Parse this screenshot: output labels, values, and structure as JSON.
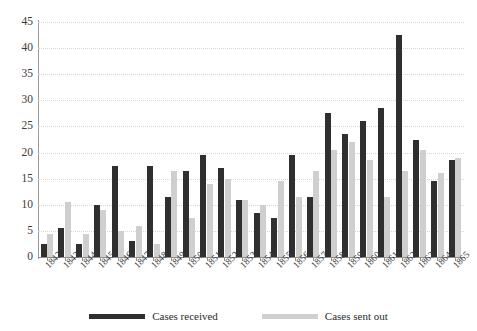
{
  "chart_data": {
    "type": "bar",
    "title": "",
    "subtitle": "",
    "xlabel": "",
    "ylabel": "",
    "ylim": [
      0,
      45
    ],
    "ytick_step": 5,
    "yticks": [
      0,
      5,
      10,
      15,
      20,
      25,
      30,
      35,
      40,
      45
    ],
    "grid": true,
    "legend_position": "bottom",
    "categories": [
      "1842",
      "1843",
      "1844",
      "1845",
      "1846",
      "1847",
      "1848",
      "1849",
      "1850",
      "1851",
      "1852",
      "1853",
      "1854",
      "1855",
      "1856",
      "1857",
      "1858",
      "1859",
      "1860",
      "1861",
      "1862",
      "1863",
      "1864",
      "1865"
    ],
    "series": [
      {
        "name": "Cases received",
        "color": "#2f2f2f",
        "values": [
          2.5,
          5.5,
          2.5,
          10,
          17.5,
          3,
          17.5,
          11.5,
          16.5,
          19.5,
          17,
          11,
          8.5,
          7.5,
          19.5,
          11.5,
          27.5,
          23.5,
          26,
          28.5,
          42.5,
          22.5,
          14.5,
          18.5
        ]
      },
      {
        "name": "Cases sent out",
        "color": "#cfcfcf",
        "values": [
          4.5,
          10.5,
          4.5,
          9,
          5,
          6,
          2.5,
          16.5,
          7.5,
          14,
          15,
          11,
          10,
          14.5,
          11.5,
          16.5,
          20.5,
          22,
          18.5,
          11.5,
          16.5,
          20.5,
          16,
          19
        ]
      }
    ]
  },
  "legend": {
    "items": [
      {
        "label": "Cases received",
        "swatch": "received"
      },
      {
        "label": "Cases sent out",
        "swatch": "sent"
      }
    ]
  },
  "colors": {
    "received": "#2f2f2f",
    "sent": "#cfcfcf",
    "axis": "#8f8f8f",
    "grid": "#d7d7d7",
    "background": "#ffffff",
    "text": "#2b2b2b"
  }
}
